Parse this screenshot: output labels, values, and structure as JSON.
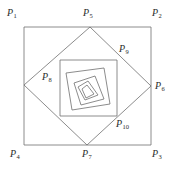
{
  "figure": {
    "kind": "geometry-diagram",
    "width": 176,
    "height": 177,
    "background_color": "#ffffff",
    "stroke_color": "#6e6e6e",
    "stroke_width": 0.8,
    "label_color": "#2b2b2b"
  },
  "labels": [
    {
      "id": "P1",
      "base": "P",
      "sub": "1",
      "text": "P1",
      "x": 7,
      "y": 8
    },
    {
      "id": "P5",
      "base": "P",
      "sub": "5",
      "text": "P5",
      "x": 83,
      "y": 8
    },
    {
      "id": "P2",
      "base": "P",
      "sub": "2",
      "text": "P2",
      "x": 152,
      "y": 8
    },
    {
      "id": "P9",
      "base": "P",
      "sub": "9",
      "text": "P9",
      "x": 119,
      "y": 44
    },
    {
      "id": "P8",
      "base": "P",
      "sub": "8",
      "text": "P8",
      "x": 42,
      "y": 72
    },
    {
      "id": "P6",
      "base": "P",
      "sub": "6",
      "text": "P6",
      "x": 155,
      "y": 81
    },
    {
      "id": "P10",
      "base": "P",
      "sub": "10",
      "text": "P10",
      "x": 116,
      "y": 119
    },
    {
      "id": "P4",
      "base": "P",
      "sub": "4",
      "text": "P4",
      "x": 10,
      "y": 149
    },
    {
      "id": "P7",
      "base": "P",
      "sub": "7",
      "text": "P7",
      "x": 82,
      "y": 149
    },
    {
      "id": "P3",
      "base": "P",
      "sub": "3",
      "text": "P3",
      "x": 152,
      "y": 149
    }
  ],
  "polygons": [
    {
      "name": "square-1-outer",
      "vertices": [
        [
          24,
          27
        ],
        [
          151,
          27
        ],
        [
          151,
          145
        ],
        [
          24,
          145
        ]
      ],
      "labeled_as": [
        "P1",
        "P2",
        "P3",
        "P4"
      ]
    },
    {
      "name": "square-2",
      "vertices": [
        [
          90,
          27
        ],
        [
          151,
          86
        ],
        [
          87,
          145
        ],
        [
          24,
          85
        ]
      ],
      "labeled_as": [
        "P5",
        "P6",
        "P7",
        "P8"
      ]
    },
    {
      "name": "square-3",
      "vertices": [
        [
          117,
          60
        ],
        [
          117,
          116
        ],
        [
          60,
          116
        ],
        [
          60,
          60
        ]
      ],
      "labeled_as": [
        "P9",
        "P10"
      ]
    },
    {
      "name": "square-4",
      "vertices": [
        [
          104,
          68
        ],
        [
          110,
          104
        ],
        [
          72,
          110
        ],
        [
          66,
          73
        ]
      ],
      "labeled_as": []
    },
    {
      "name": "square-5",
      "vertices": [
        [
          95,
          76
        ],
        [
          104,
          99
        ],
        [
          81,
          105
        ],
        [
          74,
          83
        ]
      ],
      "labeled_as": []
    },
    {
      "name": "square-6",
      "vertices": [
        [
          88,
          81
        ],
        [
          98,
          95
        ],
        [
          85,
          100
        ],
        [
          78,
          87
        ]
      ],
      "labeled_as": []
    },
    {
      "name": "square-7",
      "vertices": [
        [
          87,
          85
        ],
        [
          94,
          94
        ],
        [
          86,
          98
        ],
        [
          82,
          89
        ]
      ],
      "labeled_as": []
    }
  ]
}
